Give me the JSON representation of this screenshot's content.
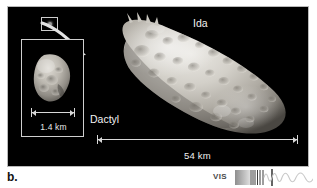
{
  "figure": {
    "caption_label": "b.",
    "panel_background": "#000000",
    "frame_color": "#b9b9b9"
  },
  "labels": {
    "ida": "Ida",
    "dactyl": "Dactyl"
  },
  "scale_bars": [
    {
      "name": "dactyl",
      "value": "1.4 km"
    },
    {
      "name": "ida",
      "value": "54 km"
    }
  ],
  "scale_values": {
    "dactyl_km": "1.4 km",
    "ida_km": "54 km"
  },
  "spectrum_indicator": {
    "band_label": "VIS",
    "icons": {
      "gradient_block": "spectrum-gradient-icon",
      "stripes": "spectrum-stripes-icon",
      "waves": "spectrum-wave-icon"
    }
  },
  "icons": {
    "locator_box": "locator-box-icon",
    "callout_arrow": "curved-arrow-icon",
    "dactyl_dot": "dactyl-dot-icon",
    "asteroid_ida": "asteroid-ida-icon",
    "asteroid_dactyl": "asteroid-dactyl-icon"
  },
  "colors": {
    "label_text": "#f2f2f2",
    "scale_line": "#d8d8d8",
    "caption_text": "#111111",
    "vis_text": "#4a4a4a"
  }
}
